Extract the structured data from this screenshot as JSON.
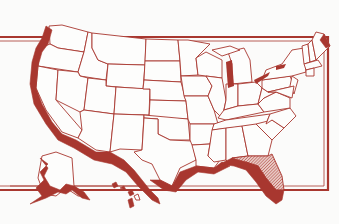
{
  "map": {
    "title": "",
    "subject": "United States of America",
    "colors": {
      "ink": "#a8372f",
      "paper": "#fbfbfa",
      "land": "#fdfdfc"
    },
    "highlighted_regions": [
      {
        "name": "Pacific Coast",
        "style": "solid"
      },
      {
        "name": "Gulf Coast",
        "style": "solid"
      },
      {
        "name": "Florida",
        "style": "hatched"
      },
      {
        "name": "Alaska coast",
        "style": "solid"
      },
      {
        "name": "Hawaii",
        "style": "solid"
      },
      {
        "name": "Lake Michigan",
        "style": "solid"
      }
    ],
    "insets": [
      "Alaska",
      "Hawaii"
    ]
  }
}
